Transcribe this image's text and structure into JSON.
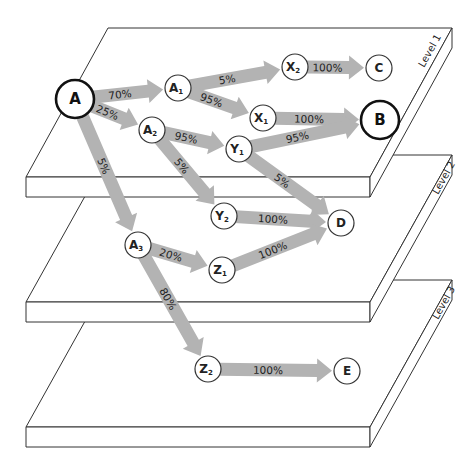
{
  "diagram": {
    "levels": [
      {
        "id": "level-1",
        "label": "Level 1"
      },
      {
        "id": "level-2",
        "label": "Level 2"
      },
      {
        "id": "level-3",
        "label": "Level 3"
      }
    ],
    "nodes": [
      {
        "id": "A",
        "label": "A",
        "sub": "",
        "x": 75,
        "y": 99,
        "r": 19,
        "emphasis": true,
        "level": 1
      },
      {
        "id": "A1",
        "label": "A",
        "sub": "1",
        "x": 178,
        "y": 88,
        "r": 13,
        "emphasis": false,
        "level": 1
      },
      {
        "id": "X2",
        "label": "X",
        "sub": "2",
        "x": 295,
        "y": 67,
        "r": 13,
        "emphasis": false,
        "level": 1
      },
      {
        "id": "C",
        "label": "C",
        "sub": "",
        "x": 379,
        "y": 68,
        "r": 13,
        "emphasis": false,
        "level": 1
      },
      {
        "id": "X1",
        "label": "X",
        "sub": "1",
        "x": 263,
        "y": 118,
        "r": 13,
        "emphasis": false,
        "level": 1
      },
      {
        "id": "B",
        "label": "B",
        "sub": "",
        "x": 380,
        "y": 120,
        "r": 19,
        "emphasis": true,
        "level": 1
      },
      {
        "id": "A2",
        "label": "A",
        "sub": "2",
        "x": 152,
        "y": 130,
        "r": 13,
        "emphasis": false,
        "level": 1
      },
      {
        "id": "Y1",
        "label": "Y",
        "sub": "1",
        "x": 239,
        "y": 149,
        "r": 13,
        "emphasis": false,
        "level": 1
      },
      {
        "id": "Y2",
        "label": "Y",
        "sub": "2",
        "x": 224,
        "y": 216,
        "r": 13,
        "emphasis": false,
        "level": 2
      },
      {
        "id": "D",
        "label": "D",
        "sub": "",
        "x": 341,
        "y": 223,
        "r": 13,
        "emphasis": false,
        "level": 2
      },
      {
        "id": "A3",
        "label": "A",
        "sub": "3",
        "x": 138,
        "y": 245,
        "r": 13,
        "emphasis": false,
        "level": 2
      },
      {
        "id": "Z1",
        "label": "Z",
        "sub": "1",
        "x": 222,
        "y": 270,
        "r": 13,
        "emphasis": false,
        "level": 2
      },
      {
        "id": "Z2",
        "label": "Z",
        "sub": "2",
        "x": 208,
        "y": 369,
        "r": 13,
        "emphasis": false,
        "level": 3
      },
      {
        "id": "E",
        "label": "E",
        "sub": "",
        "x": 347,
        "y": 371,
        "r": 13,
        "emphasis": false,
        "level": 3
      }
    ],
    "edges": [
      {
        "from": "A",
        "to": "A1",
        "label": "70%"
      },
      {
        "from": "A",
        "to": "A2",
        "label": "25%"
      },
      {
        "from": "A",
        "to": "A3",
        "label": "5%"
      },
      {
        "from": "A1",
        "to": "X2",
        "label": "5%"
      },
      {
        "from": "A1",
        "to": "X1",
        "label": "95%"
      },
      {
        "from": "X2",
        "to": "C",
        "label": "100%"
      },
      {
        "from": "X1",
        "to": "B",
        "label": "100%"
      },
      {
        "from": "A2",
        "to": "Y1",
        "label": "95%"
      },
      {
        "from": "A2",
        "to": "Y2",
        "label": "5%"
      },
      {
        "from": "Y1",
        "to": "B",
        "label": "95%"
      },
      {
        "from": "Y1",
        "to": "D",
        "label": "5%"
      },
      {
        "from": "Y2",
        "to": "D",
        "label": "100%"
      },
      {
        "from": "A3",
        "to": "Z1",
        "label": "20%"
      },
      {
        "from": "A3",
        "to": "Z2",
        "label": "80%"
      },
      {
        "from": "Z1",
        "to": "D",
        "label": "100%"
      },
      {
        "from": "Z2",
        "to": "E",
        "label": "100%"
      }
    ],
    "colors": {
      "arrow": "#b3b3b3",
      "stroke": "#333333",
      "background": "#ffffff"
    }
  }
}
